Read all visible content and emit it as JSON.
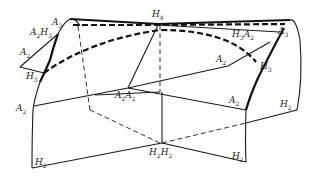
{
  "diagram": {
    "labels": {
      "a3_left": {
        "letter": "A",
        "sub": "3"
      },
      "a2h3_left_letter1": "A",
      "a2h3_left_sub1": "2",
      "a2h3_left_letter2": "H",
      "a2h3_left_sub2": "3",
      "a2_upper_left": {
        "letter": "A",
        "sub": "2"
      },
      "h3_left": {
        "letter": "H",
        "sub": "3"
      },
      "a2_lower_left": {
        "letter": "A",
        "sub": "2"
      },
      "h4_top": {
        "letter": "H",
        "sub": "4"
      },
      "h3a2_right_letter1": "H",
      "h3a2_right_sub1": "3",
      "h3a2_right_letter2": "A",
      "h3a2_right_sub2": "2",
      "a3_right": {
        "letter": "A",
        "sub": "3"
      },
      "a2_center_right": {
        "letter": "A",
        "sub": "2"
      },
      "h3_right": {
        "letter": "H",
        "sub": "3"
      },
      "a2a2_center_letter1": "A",
      "a2a2_center_sub1": "2",
      "a2a2_center_letter2": "A",
      "a2a2_center_sub2": "2",
      "a2_right_mid": {
        "letter": "A",
        "sub": "2"
      },
      "h2_right": {
        "letter": "H",
        "sub": "2"
      },
      "h2_bottom_left": {
        "letter": "H",
        "sub": "2"
      },
      "h2h2_bottom_letter1": "H",
      "h2h2_bottom_sub1": "2",
      "h2h2_bottom_letter2": "H",
      "h2h2_bottom_sub2": "2",
      "h2_bottom_right": {
        "letter": "H",
        "sub": "2"
      }
    }
  }
}
